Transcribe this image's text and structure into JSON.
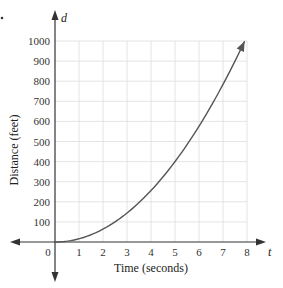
{
  "chart_data": {
    "type": "line",
    "title": "",
    "xlabel": "Time (seconds)",
    "ylabel": "Distance (feet)",
    "x_axis_variable": "t",
    "y_axis_variable": "d",
    "x_ticks": [
      "0",
      "1",
      "2",
      "3",
      "4",
      "5",
      "6",
      "7",
      "8"
    ],
    "y_ticks": [
      "100",
      "200",
      "300",
      "400",
      "500",
      "600",
      "700",
      "800",
      "900",
      "1000"
    ],
    "xlim": [
      0,
      8
    ],
    "ylim": [
      0,
      1000
    ],
    "grid": true,
    "legend": null,
    "series": [
      {
        "name": "d = 16t^2",
        "x": [
          0,
          1,
          2,
          3,
          4,
          5,
          6,
          7,
          7.9
        ],
        "values": [
          0,
          16,
          64,
          144,
          256,
          400,
          576,
          784,
          1000
        ]
      }
    ],
    "colors": {
      "curve": "#555555",
      "grid": "#dddddd",
      "axis": "#333333"
    }
  }
}
